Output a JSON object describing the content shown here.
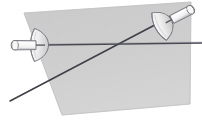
{
  "illustration": {
    "title": "Two crossed fencing foils over a gray quadrilateral",
    "subject": "fencing-foils",
    "alt_text": "Line drawing of two fencing foils with bell guards crossing diagonally over a light gray tilted rectangle",
    "canvas": {
      "width": 202,
      "height": 121,
      "background_color": "#ffffff"
    },
    "colors": {
      "background": "#ffffff",
      "panel_fill": "#cccccc",
      "panel_fill_light": "#d6d6d6",
      "panel_stroke": "#b8b8b8",
      "blade_dark": "#3c3c46",
      "blade_mid": "#5a5a64",
      "outline": "#6e6e78",
      "handle_fill": "#f2f2f2",
      "handle_shade": "#dcdcdc",
      "guard_fill": "#ededed",
      "guard_shade": "#cfcfcf"
    },
    "panel": {
      "name": "gray-quadrilateral",
      "points": "24,13 191,2 190,104 62,115",
      "fill": "#cccccc",
      "stroke": "#c2c2c2"
    },
    "blades": [
      {
        "name": "horizontal-blade",
        "label": "left foil blade",
        "x1": 45,
        "y1": 45,
        "x2": 202,
        "y2": 43,
        "width": 1.6,
        "color": "#4a4a55"
      },
      {
        "name": "diagonal-blade",
        "label": "right foil blade",
        "x1": 10,
        "y1": 101,
        "x2": 170,
        "y2": 17,
        "width": 1.5,
        "color": "#3c3c46"
      }
    ],
    "crossing_point": {
      "x": 127,
      "y": 45
    },
    "foils": [
      {
        "name": "left-foil",
        "orientation": "horizontal",
        "guard": {
          "cx": 40,
          "cy": 44,
          "rx": 8,
          "ry": 16
        },
        "handle": {
          "x1": 12,
          "y1": 46,
          "x2": 36,
          "y2": 45,
          "thickness": 11
        },
        "pommel_x": 12
      },
      {
        "name": "right-foil",
        "orientation": "diagonal",
        "guard": {
          "cx": 164,
          "cy": 24,
          "rx": 8,
          "ry": 16,
          "rotation": -28
        },
        "handle": {
          "x1": 172,
          "y1": 22,
          "x2": 194,
          "y2": 10,
          "thickness": 11
        },
        "pommel_x": 194
      }
    ]
  }
}
